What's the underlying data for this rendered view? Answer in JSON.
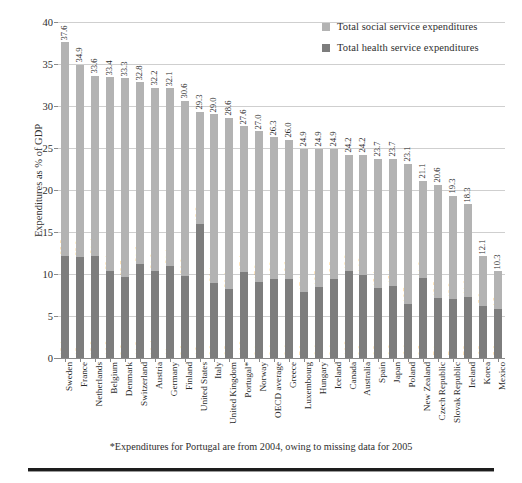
{
  "chart_data": {
    "type": "bar",
    "subtype": "stacked-column",
    "title": "",
    "xlabel": "",
    "ylabel": "Expenditures as % of GDP",
    "ylim": [
      0,
      40
    ],
    "yticks": [
      0,
      5,
      10,
      15,
      20,
      25,
      30,
      35,
      40
    ],
    "grid": true,
    "legend_position": "top-right",
    "categories": [
      "Sweden",
      "France",
      "Netherlands",
      "Belgium",
      "Denmark",
      "Switzerland",
      "Austria",
      "Germany",
      "Finland",
      "United States",
      "Italy",
      "United Kingdom",
      "Portugal*",
      "Norway",
      "OECD average",
      "Greece",
      "Luxembourg",
      "Hungary",
      "Iceland",
      "Canada",
      "Australia",
      "Spain",
      "Japan",
      "Poland",
      "New Zealand",
      "Czech Republic",
      "Slovak Republic",
      "Ireland",
      "Korea",
      "Mexico"
    ],
    "series": [
      {
        "name": "Total social service expenditures",
        "color": "#b3b3b3",
        "values": [
          25.5,
          22.9,
          21.4,
          23.1,
          23.7,
          21.6,
          21.8,
          21.1,
          20.8,
          13.3,
          20.1,
          20.4,
          17.4,
          17.9,
          16.9,
          16.6,
          17.1,
          16.5,
          15.5,
          13.9,
          14.3,
          15.4,
          15.1,
          16.7,
          11.6,
          13.5,
          12.3,
          11.0,
          5.9,
          4.5
        ]
      },
      {
        "name": "Total health service expenditures",
        "color": "#7d7d7d",
        "values": [
          12.1,
          12,
          12.2,
          10.3,
          9.6,
          11.2,
          10.4,
          11,
          9.8,
          16,
          8.9,
          8.2,
          10.2,
          9.1,
          9.4,
          9.4,
          7.8,
          8.4,
          9.4,
          10.3,
          9.9,
          8.3,
          8.6,
          6.4,
          9.5,
          7.1,
          7,
          7.3,
          6.2,
          5.8
        ]
      }
    ],
    "totals": [
      37.6,
      34.9,
      33.6,
      33.4,
      33.3,
      32.8,
      32.2,
      32.1,
      30.6,
      29.3,
      29.0,
      28.6,
      27.6,
      27.0,
      26.3,
      26.0,
      24.9,
      24.9,
      24.9,
      24.2,
      24.2,
      23.7,
      23.7,
      23.1,
      21.1,
      20.6,
      19.3,
      18.3,
      12.1,
      10.3
    ],
    "social_labels": [
      "25.5",
      "22.9",
      "21.4",
      "23.1",
      "23.7",
      "21.6",
      "21.8",
      "21.1",
      "20.8",
      "13.3",
      "20.1",
      "20.4",
      "17.4",
      "17.9",
      "16.9",
      "16.6",
      "17.1",
      "16.5",
      "15.5",
      "13.9",
      "14.3",
      "15.4",
      "15.1",
      "16.7",
      "11.6",
      "13.5",
      "12.3",
      "11.0",
      "5.9",
      "4.5"
    ],
    "health_labels": [
      "12.1",
      "12",
      "12.2",
      "10.3",
      "9.6",
      "11.2",
      "10.4",
      "11",
      "9.8",
      "16",
      "8.9",
      "8.2",
      "10.2",
      "9.1",
      "9.4",
      "9.4",
      "7.8",
      "8.4",
      "9.4",
      "10.3",
      "9.9",
      "8.3",
      "8.6",
      "6.4",
      "9.5",
      "7.1",
      "7",
      "7.3",
      "6.2",
      "5.8"
    ],
    "total_labels": [
      "37.6",
      "34.9",
      "33.6",
      "33.4",
      "33.3",
      "32.8",
      "32.2",
      "32.1",
      "30.6",
      "29.3",
      "29.0",
      "28.6",
      "27.6",
      "27.0",
      "26.3",
      "26.0",
      "24.9",
      "24.9",
      "24.9",
      "24.2",
      "24.2",
      "23.7",
      "23.7",
      "23.1",
      "21.1",
      "20.6",
      "19.3",
      "18.3",
      "12.1",
      "10.3"
    ]
  },
  "legend": {
    "items": [
      {
        "label": "Total social service expenditures",
        "color": "#b3b3b3"
      },
      {
        "label": "Total health service expenditures",
        "color": "#7d7d7d"
      }
    ]
  },
  "axes": {
    "y_title": "Expenditures as % of GDP",
    "y_tick_labels": [
      "40",
      "35",
      "30",
      "25",
      "20",
      "15",
      "10",
      "5",
      "0"
    ]
  },
  "footnote": "*Expenditures for Portugal are from 2004, owing to missing data for 2005"
}
